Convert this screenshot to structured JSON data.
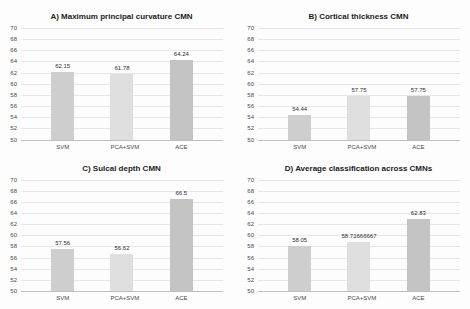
{
  "figure": {
    "background": "#fdfdfd",
    "gridline_color": "#e7e7e7",
    "axis_line_color": "#bfbfbf"
  },
  "chart_data": [
    {
      "type": "bar",
      "title": "A) Maximum principal curvature CMN",
      "categories": [
        "SVM",
        "PCA+SVM",
        "ACE"
      ],
      "values": [
        62.15,
        61.78,
        64.24
      ],
      "value_labels": [
        "62.15",
        "61.78",
        "64.24"
      ],
      "xlabel": "",
      "ylabel": "",
      "ylim": [
        50,
        70
      ],
      "ytick_step": 2,
      "grid": "on",
      "legend": "none",
      "bar_colors": [
        "#cecece",
        "#dfdfdf",
        "#c4c4c4"
      ]
    },
    {
      "type": "bar",
      "title": "B) Cortical thickness CMN",
      "categories": [
        "SVM",
        "PCA+SVM",
        "ACE"
      ],
      "values": [
        54.44,
        57.75,
        57.75
      ],
      "value_labels": [
        "54.44",
        "57.75",
        "57.75"
      ],
      "xlabel": "",
      "ylabel": "",
      "ylim": [
        50,
        70
      ],
      "ytick_step": 2,
      "grid": "on",
      "legend": "none",
      "bar_colors": [
        "#cecece",
        "#dfdfdf",
        "#c4c4c4"
      ]
    },
    {
      "type": "bar",
      "title": "C) Sulcal depth CMN",
      "categories": [
        "SVM",
        "PCA+SVM",
        "ACE"
      ],
      "values": [
        57.56,
        56.62,
        66.5
      ],
      "value_labels": [
        "57.56",
        "56.62",
        "66.5"
      ],
      "xlabel": "",
      "ylabel": "",
      "ylim": [
        50,
        70
      ],
      "ytick_step": 2,
      "grid": "on",
      "legend": "none",
      "bar_colors": [
        "#cecece",
        "#dfdfdf",
        "#c4c4c4"
      ]
    },
    {
      "type": "bar",
      "title": "D) Average classification across CMNs",
      "categories": [
        "SVM",
        "PCA+SVM",
        "ACE"
      ],
      "values": [
        58.05,
        58.71666667,
        62.83
      ],
      "value_labels": [
        "58.05",
        "58.71666667",
        "62.83"
      ],
      "xlabel": "",
      "ylabel": "",
      "ylim": [
        50,
        70
      ],
      "ytick_step": 2,
      "grid": "on",
      "legend": "none",
      "bar_colors": [
        "#cecece",
        "#dfdfdf",
        "#c4c4c4"
      ]
    }
  ]
}
